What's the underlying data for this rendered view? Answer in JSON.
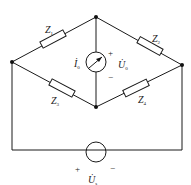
{
  "diagram": {
    "type": "AC bridge circuit",
    "colors": {
      "line": "#1a1a1a",
      "background": "#ffffff"
    },
    "impedances": [
      {
        "name": "Z",
        "sub": "1",
        "branch": "left-node to top-node"
      },
      {
        "name": "Z",
        "sub": "2",
        "branch": "top-node to right-node"
      },
      {
        "name": "Z",
        "sub": "3",
        "branch": "left-node to bottom-node"
      },
      {
        "name": "Z",
        "sub": "4",
        "branch": "bottom-node to right-node"
      }
    ],
    "meter": {
      "current_label": "İ",
      "current_sub": "0",
      "voltage_label": "U̇",
      "voltage_sub": "0",
      "plus": "+",
      "minus": "−"
    },
    "source": {
      "label": "U̇",
      "sub": "s",
      "plus": "+",
      "minus": "−"
    }
  }
}
